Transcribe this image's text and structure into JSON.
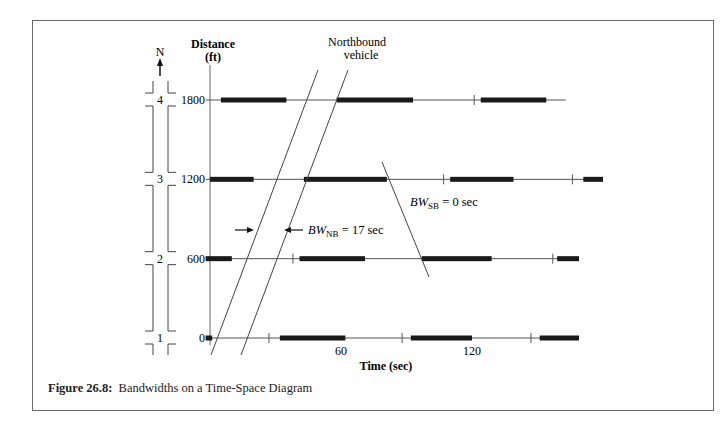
{
  "figure": {
    "caption_label": "Figure 26.8:",
    "caption_text": "Bandwidths on a Time-Space Diagram"
  },
  "compass": {
    "label": "N",
    "icon": "north-arrow-icon"
  },
  "axes": {
    "y_title_line1": "Distance",
    "y_title_line2": "(ft)",
    "x_title": "Time (sec)",
    "y_ticks": [
      "0",
      "600",
      "1200",
      "1800"
    ],
    "x_ticks": [
      "60",
      "120"
    ]
  },
  "annotations": {
    "northbound_line1": "Northbound",
    "northbound_line2": "vehicle",
    "bw_nb_prefix": "BW",
    "bw_nb_sub": "NB",
    "bw_nb_value": " = 17 sec",
    "bw_sb_prefix": "BW",
    "bw_sb_sub": "SB",
    "bw_sb_value": " = 0 sec"
  },
  "chart_data": {
    "type": "time-space-diagram",
    "title": "Bandwidths on a Time-Space Diagram",
    "xlabel": "Time (sec)",
    "ylabel": "Distance (ft)",
    "x_ticks": [
      60,
      120
    ],
    "y_ticks": [
      0,
      600,
      1200,
      1800
    ],
    "xlim": [
      0,
      180
    ],
    "ylim": [
      0,
      2000
    ],
    "intersections": [
      {
        "id": "1",
        "distance_ft": 0,
        "red_phases_sec": [
          [
            -2,
            1
          ],
          [
            32,
            62
          ],
          [
            92,
            120
          ],
          [
            151,
            169
          ]
        ],
        "tick_marks_sec": [
          27,
          88,
          147
        ]
      },
      {
        "id": "2",
        "distance_ft": 600,
        "red_phases_sec": [
          [
            -2,
            10
          ],
          [
            41,
            71
          ],
          [
            97,
            129
          ],
          [
            159,
            169
          ]
        ],
        "tick_marks_sec": [
          38,
          157
        ]
      },
      {
        "id": "3",
        "distance_ft": 1200,
        "red_phases_sec": [
          [
            0,
            20
          ],
          [
            43,
            81
          ],
          [
            110,
            139
          ],
          [
            171,
            180
          ]
        ],
        "tick_marks_sec": [
          107,
          166
        ]
      },
      {
        "id": "4",
        "distance_ft": 1800,
        "red_phases_sec": [
          [
            5,
            35
          ],
          [
            58,
            93
          ],
          [
            124,
            154
          ]
        ],
        "tick_marks_sec": [
          121
        ],
        "line_end_sec": 163
      }
    ],
    "northbound_band": {
      "label": "Northbound vehicle",
      "bandwidth_sec": 17,
      "left_edge": [
        [
          0,
          -100
        ],
        [
          50,
          2050
        ]
      ],
      "right_edge": [
        [
          14,
          -100
        ],
        [
          63,
          2050
        ]
      ]
    },
    "southbound_band": {
      "label": "BW_SB",
      "bandwidth_sec": 0,
      "line": [
        [
          78,
          1150
        ],
        [
          100,
          810
        ]
      ]
    },
    "annotations": [
      "Northbound vehicle",
      "BW_NB = 17 sec",
      "BW_SB = 0 sec"
    ]
  },
  "colors": {
    "bar": "#1a1a1a",
    "line": "#555555",
    "frame": "#6b6b6b"
  }
}
